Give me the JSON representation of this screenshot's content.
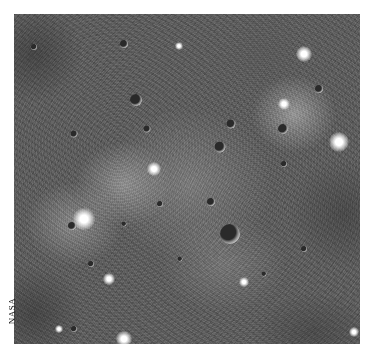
{
  "image": {
    "subject": "grayscale orbital photograph of a large cratered impact basin",
    "credit": "NASA",
    "tone": "grayscale"
  },
  "craters": [
    {
      "x": 216,
      "y": 220,
      "d": 20
    },
    {
      "x": 122,
      "y": 86,
      "d": 12
    },
    {
      "x": 110,
      "y": 30,
      "d": 8
    },
    {
      "x": 60,
      "y": 120,
      "d": 7
    },
    {
      "x": 133,
      "y": 115,
      "d": 7
    },
    {
      "x": 206,
      "y": 133,
      "d": 11
    },
    {
      "x": 217,
      "y": 110,
      "d": 9
    },
    {
      "x": 197,
      "y": 188,
      "d": 8
    },
    {
      "x": 146,
      "y": 190,
      "d": 6
    },
    {
      "x": 110,
      "y": 210,
      "d": 5
    },
    {
      "x": 58,
      "y": 212,
      "d": 8
    },
    {
      "x": 269,
      "y": 115,
      "d": 10
    },
    {
      "x": 305,
      "y": 75,
      "d": 8
    },
    {
      "x": 270,
      "y": 150,
      "d": 6
    },
    {
      "x": 290,
      "y": 235,
      "d": 6
    },
    {
      "x": 77,
      "y": 250,
      "d": 6
    },
    {
      "x": 60,
      "y": 315,
      "d": 6
    },
    {
      "x": 166,
      "y": 245,
      "d": 5
    },
    {
      "x": 250,
      "y": 260,
      "d": 5
    },
    {
      "x": 20,
      "y": 33,
      "d": 6
    }
  ],
  "bright_spots": [
    {
      "x": 70,
      "y": 205,
      "d": 22
    },
    {
      "x": 140,
      "y": 155,
      "d": 14
    },
    {
      "x": 325,
      "y": 128,
      "d": 20
    },
    {
      "x": 110,
      "y": 325,
      "d": 16
    },
    {
      "x": 95,
      "y": 265,
      "d": 12
    },
    {
      "x": 230,
      "y": 268,
      "d": 10
    },
    {
      "x": 340,
      "y": 318,
      "d": 10
    },
    {
      "x": 165,
      "y": 32,
      "d": 8
    },
    {
      "x": 290,
      "y": 40,
      "d": 16
    },
    {
      "x": 270,
      "y": 90,
      "d": 12
    },
    {
      "x": 45,
      "y": 315,
      "d": 8
    }
  ]
}
